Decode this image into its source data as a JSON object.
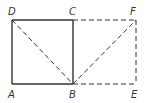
{
  "diagram": {
    "type": "geometry",
    "points": {
      "A": {
        "label": "A",
        "x": 12,
        "y": 84
      },
      "B": {
        "label": "B",
        "x": 73,
        "y": 84
      },
      "C": {
        "label": "C",
        "x": 73,
        "y": 20
      },
      "D": {
        "label": "D",
        "x": 12,
        "y": 20
      },
      "E": {
        "label": "E",
        "x": 136,
        "y": 84
      },
      "F": {
        "label": "F",
        "x": 136,
        "y": 20
      }
    },
    "solid_segments": [
      "AB",
      "BC",
      "CD",
      "DA"
    ],
    "dashed_segments": [
      "DB",
      "BF",
      "CF",
      "FE",
      "BE"
    ],
    "colors": {
      "line": "#333333",
      "background": "#ffffff"
    }
  }
}
